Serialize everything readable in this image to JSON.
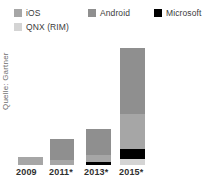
{
  "chart_data": {
    "type": "bar",
    "title": "",
    "subtitle": "",
    "xlabel": "",
    "ylabel": "",
    "stacked": true,
    "grid": false,
    "legend_position": "top",
    "source_note": "Quelle: Gartner",
    "categories": [
      "2009",
      "2011*",
      "2013*",
      "2015*"
    ],
    "series": [
      {
        "name": "Android",
        "color": "#8f8f8f",
        "values": [
          0,
          21,
          26,
          66
        ]
      },
      {
        "name": "iOS",
        "color": "#a6a6a6",
        "values": [
          8,
          5,
          7,
          35
        ]
      },
      {
        "name": "Microsoft",
        "color": "#000000",
        "values": [
          0,
          0,
          3,
          10
        ]
      },
      {
        "name": "QNX (RIM)",
        "color": "#d4d4d4",
        "values": [
          0,
          0,
          0,
          6
        ]
      }
    ],
    "stack_order_bottom_to_top": [
      "QNX (RIM)",
      "Microsoft",
      "iOS",
      "Android"
    ],
    "bar_totals": [
      8,
      26,
      36,
      117
    ],
    "ylim": [
      0,
      120
    ],
    "units": "pixels-of-bar-height"
  },
  "legend": {
    "entries": [
      {
        "label": "iOS",
        "color": "#a6a6a6"
      },
      {
        "label": "Android",
        "color": "#8f8f8f"
      },
      {
        "label": "Microsoft",
        "color": "#000000"
      },
      {
        "label": "QNX (RIM)",
        "color": "#d4d4d4"
      }
    ]
  },
  "axis": {
    "x_tick_labels": [
      "2009",
      "2011*",
      "2013*",
      "2015*"
    ]
  },
  "footer": {
    "source": "Quelle: Gartner"
  }
}
